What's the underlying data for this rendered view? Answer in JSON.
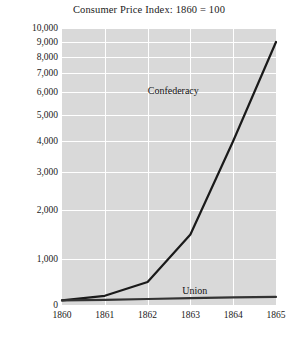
{
  "chart_data": {
    "type": "line",
    "title": "Consumer Price Index: 1860 = 100",
    "xlabel": "",
    "ylabel": "",
    "x": [
      1860,
      1861,
      1862,
      1863,
      1864,
      1865
    ],
    "xticklabels": [
      "1860",
      "1861",
      "1862",
      "1863",
      "1864",
      "1865"
    ],
    "yticks": [
      0,
      1000,
      2000,
      3000,
      4000,
      5000,
      6000,
      7000,
      8000,
      9000,
      10000
    ],
    "yticklabels": [
      "0",
      "1,000",
      "2,000",
      "3,000",
      "4,000",
      "5,000",
      "6,000",
      "7,000",
      "8,000",
      "9,000",
      "10,000"
    ],
    "ylim": [
      0,
      10000
    ],
    "xlim": [
      1860,
      1865
    ],
    "yscale": "log-like (compressed toward top)",
    "grid": true,
    "legend": "inline annotations",
    "plot_background": "#d9d9d9",
    "gridline_color": "#ffffff",
    "line_color": "#1a1a1a",
    "series": [
      {
        "name": "Confederacy",
        "values": [
          100,
          200,
          500,
          1500,
          4000,
          9000
        ],
        "label_x": 1862.6,
        "label_y": 6100,
        "color": "#1a1a1a"
      },
      {
        "name": "Union",
        "values": [
          100,
          110,
          130,
          150,
          165,
          175
        ],
        "label_x": 1863.1,
        "label_y": 330,
        "color": "#333333"
      }
    ],
    "annotations": [
      {
        "text": "Confederacy",
        "series": "Confederacy"
      },
      {
        "text": "Union",
        "series": "Union"
      }
    ]
  }
}
